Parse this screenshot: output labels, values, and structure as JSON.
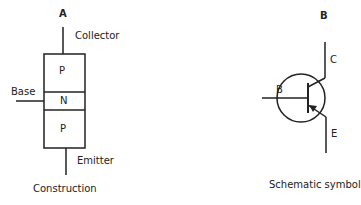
{
  "panels": {
    "a": {
      "letter": "A",
      "caption": "Construction",
      "terminals": {
        "collector": "Collector",
        "base": "Base",
        "emitter": "Emitter"
      },
      "layers": [
        "P",
        "N",
        "P"
      ]
    },
    "b": {
      "letter": "B",
      "caption": "Schematic symbol",
      "terminals": {
        "collector": "C",
        "base": "B",
        "emitter": "E"
      }
    }
  },
  "colors": {
    "line": "#222222",
    "background": "#ffffff"
  }
}
